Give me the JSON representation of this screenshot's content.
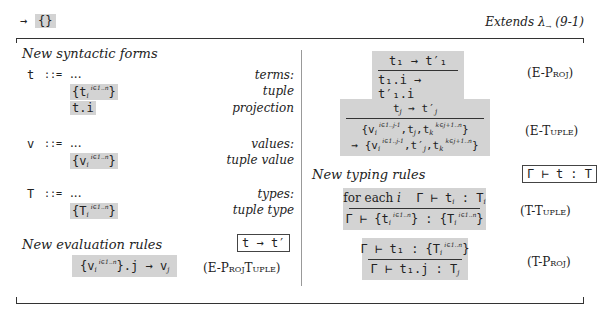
{
  "header": {
    "arrow": "→",
    "braces": "{}",
    "extends": "Extends λ",
    "extends_sub": "→",
    "extends_ref": "(9-1)"
  },
  "syntax": {
    "title": "New syntactic forms",
    "terms": {
      "symbol": "t",
      "defn": "::=",
      "ellipsis": "...",
      "label": "terms:",
      "items": [
        {
          "code": "{t",
          "sub": "i",
          "sup": "i∈1..n",
          "close": "}",
          "label": "tuple"
        },
        {
          "code": "t.i",
          "label": "projection"
        }
      ]
    },
    "values": {
      "symbol": "v",
      "defn": "::=",
      "ellipsis": "...",
      "label": "values:",
      "items": [
        {
          "code": "{v",
          "sub": "i",
          "sup": "i∈1..n",
          "close": "}",
          "label": "tuple value"
        }
      ]
    },
    "types": {
      "symbol": "T",
      "defn": "::=",
      "ellipsis": "...",
      "label": "types:",
      "items": [
        {
          "code": "{T",
          "sub": "i",
          "sup": "i∈1..n",
          "close": "}",
          "label": "tuple type"
        }
      ]
    }
  },
  "evaluation": {
    "title": "New evaluation rules",
    "judgment": "t → t′",
    "proj_tuple": {
      "lhs_open": "{v",
      "sub": "i",
      "sup": "i∈1..n",
      "lhs_close": "}.j → v",
      "rhs_sub": "j",
      "name": "(E-ProjTuple)"
    },
    "e_proj": {
      "premise": "t₁ → t′₁",
      "conclusion": "t₁.i → t′₁.i",
      "name": "(E-Proj)"
    },
    "e_tuple": {
      "premise_a": "t",
      "premise_sub": "j",
      "premise_b": " → t′",
      "premise_sub2": "j",
      "line1_a": "{v",
      "line1_sub_i": "i",
      "line1_sup1": "i∈1..j-1",
      "line1_b": ",t",
      "line1_sub_j": "j",
      "line1_c": ",t",
      "line1_sub_k": "k",
      "line1_sup2": "k∈j+1..n",
      "line1_d": "}",
      "line2_a": "→ {v",
      "line2_sub_i": "i",
      "line2_sup1": "i∈1..j-1",
      "line2_b": ",t′",
      "line2_sub_j": "j",
      "line2_c": ",t",
      "line2_sub_k": "k",
      "line2_sup2": "k∈j+1..n",
      "line2_d": "}",
      "name": "(E-Tuple)"
    }
  },
  "typing": {
    "title": "New typing rules",
    "judgment": "Γ ⊢ t : T",
    "t_tuple": {
      "premise_a": "for each ",
      "premise_i": "i",
      "premise_b": "Γ ⊢ t",
      "premise_sub": "i",
      "premise_c": " : T",
      "premise_sub2": "i",
      "concl_a": "Γ ⊢ {t",
      "concl_sub": "i",
      "concl_sup": "i∈1..n",
      "concl_b": "} : {T",
      "concl_sub2": "i",
      "concl_sup2": "i∈1..n",
      "concl_c": "}",
      "name": "(T-Tuple)"
    },
    "t_proj": {
      "premise_a": "Γ ⊢ t₁ : {T",
      "premise_sub": "i",
      "premise_sup": "i∈1..n",
      "premise_b": "}",
      "concl_a": "Γ ⊢ t₁.j : T",
      "concl_sub": "j",
      "name": "(T-Proj)"
    }
  },
  "colors": {
    "highlight": "#d3d3d3",
    "rule_border": "#444444",
    "text": "#222222"
  }
}
